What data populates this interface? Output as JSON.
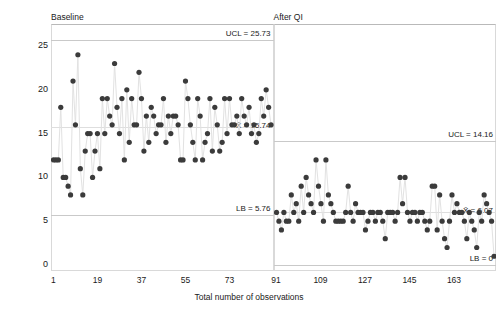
{
  "chart_data": {
    "type": "scatter",
    "title": "",
    "xlabel": "Total number of observations",
    "ylabel": "Scanner idle time by phase",
    "ylim": [
      0,
      26.5
    ],
    "yticks": [
      0,
      5,
      10,
      15,
      20,
      25
    ],
    "grid": false,
    "legend": "none",
    "point_color": "#3b3b3b",
    "line_color": "#e2e2e2",
    "reference_line_color": "#c9c9c9",
    "panels": [
      {
        "name": "baseline",
        "strip_label": "Baseline",
        "xlim": [
          0,
          91
        ],
        "xticks": [
          1,
          19,
          37,
          55,
          73
        ],
        "xtick_labels": [
          "1",
          "19",
          "37",
          "55",
          "73"
        ],
        "reference_lines": [
          {
            "id": "ucl",
            "label": "UCL = 25.73",
            "value": 25.73,
            "position": "above"
          },
          {
            "id": "center",
            "label": "X̄ = 15.74",
            "value": 15.74,
            "position": "center"
          },
          {
            "id": "lb",
            "label": "LB = 5.76",
            "value": 5.76,
            "position": "above"
          }
        ],
        "x": [
          1,
          2,
          3,
          4,
          5,
          6,
          7,
          8,
          9,
          10,
          11,
          12,
          13,
          14,
          15,
          16,
          17,
          18,
          19,
          20,
          21,
          22,
          23,
          24,
          25,
          26,
          27,
          28,
          29,
          30,
          31,
          32,
          33,
          34,
          35,
          36,
          37,
          38,
          39,
          40,
          41,
          42,
          43,
          44,
          45,
          46,
          47,
          48,
          49,
          50,
          51,
          52,
          53,
          54,
          55,
          56,
          57,
          58,
          59,
          60,
          61,
          62,
          63,
          64,
          65,
          66,
          67,
          68,
          69,
          70,
          71,
          72,
          73,
          74,
          75,
          76,
          77,
          78,
          79,
          80,
          81,
          82,
          83,
          84,
          85,
          86,
          87,
          88,
          89,
          90
        ],
        "y": [
          12,
          12,
          12,
          18,
          10,
          10,
          9,
          8,
          21,
          16,
          24,
          11,
          8,
          13,
          15,
          15,
          10,
          13,
          15,
          11,
          19,
          15,
          19,
          17,
          16,
          23,
          18,
          15,
          19,
          12,
          20,
          14,
          19,
          16,
          16,
          22,
          19,
          13,
          17,
          14,
          18,
          17,
          15,
          16,
          16,
          19,
          14,
          17,
          15,
          17,
          17,
          16,
          12,
          12,
          21,
          19,
          16,
          14,
          12,
          19,
          17,
          12,
          14,
          15,
          19,
          13,
          18,
          16,
          13,
          14,
          19,
          15,
          19,
          16,
          16,
          17,
          15,
          19,
          17,
          16,
          18,
          15,
          16,
          14,
          15,
          19,
          17,
          20,
          18,
          16
        ]
      },
      {
        "name": "after_qi",
        "strip_label": "After QI",
        "xlim": [
          90,
          180
        ],
        "xticks": [
          91,
          109,
          127,
          145,
          163
        ],
        "xtick_labels": [
          "91",
          "109",
          "127",
          "145",
          "163"
        ],
        "reference_lines": [
          {
            "id": "ucl",
            "label": "UCL = 14.16",
            "value": 14.16,
            "position": "above"
          },
          {
            "id": "center",
            "label": "X̄ = 6.07",
            "value": 6.07,
            "position": "center"
          },
          {
            "id": "lb",
            "label": "LB = 0",
            "value": 0,
            "position": "above"
          }
        ],
        "x": [
          91,
          92,
          93,
          94,
          95,
          96,
          97,
          98,
          99,
          100,
          101,
          102,
          103,
          104,
          105,
          106,
          107,
          108,
          109,
          110,
          111,
          112,
          113,
          114,
          115,
          116,
          117,
          118,
          119,
          120,
          121,
          122,
          123,
          124,
          125,
          126,
          127,
          128,
          129,
          130,
          131,
          132,
          133,
          134,
          135,
          136,
          137,
          138,
          139,
          140,
          141,
          142,
          143,
          144,
          145,
          146,
          147,
          148,
          149,
          150,
          151,
          152,
          153,
          154,
          155,
          156,
          157,
          158,
          159,
          160,
          161,
          162,
          163,
          164,
          165,
          166,
          167,
          168,
          169,
          170,
          171,
          172,
          173,
          174,
          175,
          176,
          177,
          178,
          179
        ],
        "y": [
          6,
          5,
          4,
          6,
          5,
          5,
          8,
          6,
          7,
          5,
          9,
          6,
          10,
          8,
          7,
          6,
          12,
          9,
          7,
          5,
          12,
          8,
          7,
          6,
          5,
          5,
          5,
          5,
          6,
          9,
          6,
          5,
          7,
          6,
          6,
          6,
          4,
          5,
          6,
          6,
          5,
          6,
          6,
          5,
          3,
          6,
          6,
          6,
          5,
          6,
          10,
          7,
          10,
          6,
          5,
          6,
          6,
          5,
          6,
          6,
          5,
          4,
          5,
          9,
          9,
          4,
          8,
          5,
          3,
          2,
          5,
          8,
          6,
          7,
          6,
          6,
          5,
          3,
          6,
          5,
          4,
          2,
          6,
          5,
          8,
          7,
          6,
          5,
          1
        ]
      }
    ]
  }
}
